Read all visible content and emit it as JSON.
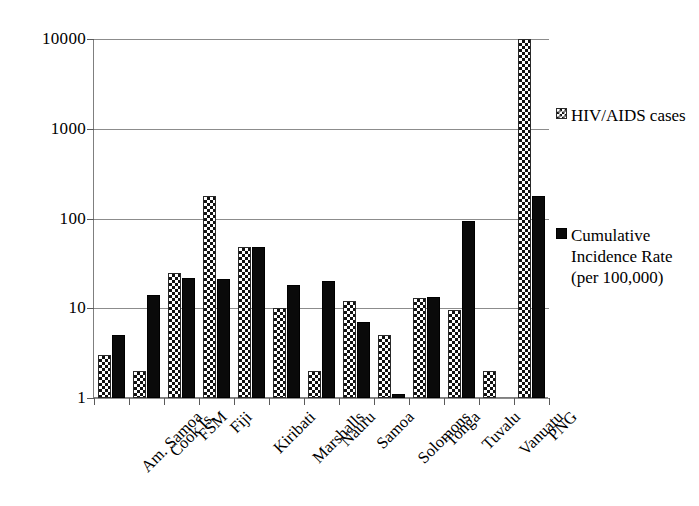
{
  "chart_data": {
    "type": "bar",
    "title": "",
    "subtitle": "",
    "xlabel": "",
    "ylabel": "",
    "yscale": "log",
    "ylim": [
      1,
      10000
    ],
    "yticks": [
      1,
      10,
      100,
      1000,
      10000
    ],
    "ytick_labels": [
      "1",
      "10",
      "100",
      "1000",
      "10000"
    ],
    "grid": "horizontal",
    "legend_position": "right",
    "categories": [
      "Am. Samoa",
      "Cook Is.",
      "FSM",
      "Fiji",
      "Kiribati",
      "Marshalls",
      "Nauru",
      "Samoa",
      "Solomons",
      "Tonga",
      "Tuvalu",
      "Vanuatu",
      "PNG"
    ],
    "series": [
      {
        "name": "HIV/AIDS cases",
        "pattern": "checker",
        "values": [
          3,
          2,
          25,
          180,
          48,
          10,
          2,
          12,
          5,
          13,
          9.5,
          2,
          10000
        ]
      },
      {
        "name": "Cumulative Incidence Rate (per 100,000)",
        "pattern": "solid",
        "values": [
          5,
          14,
          22,
          21,
          48,
          18,
          20,
          7,
          1.1,
          13.5,
          95,
          null,
          180
        ]
      }
    ]
  },
  "legend": {
    "entries": [
      {
        "label": "HIV/AIDS cases",
        "pattern": "checker"
      },
      {
        "label": "Cumulative Incidence Rate (per 100,000)",
        "pattern": "solid"
      }
    ]
  },
  "colors": {
    "series_checker_fg": "#111111",
    "series_checker_bg": "#ffffff",
    "series_solid": "#0a0a0a",
    "gridline": "#8c8c8c",
    "axis": "#7f7f7f",
    "text": "#000000",
    "background": "#ffffff"
  }
}
